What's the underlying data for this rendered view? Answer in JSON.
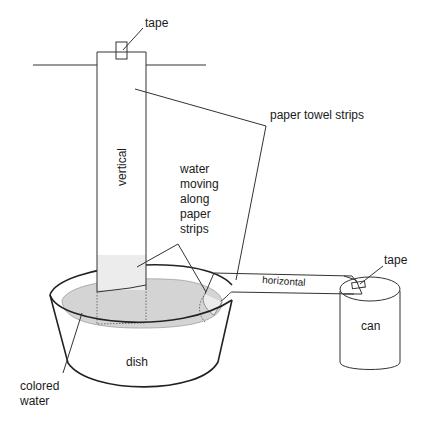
{
  "diagram": {
    "type": "experiment setup illustration",
    "labels": {
      "tape_top": "tape",
      "paper_towel_strips": "paper towel strips",
      "vertical": "vertical",
      "water_moving": [
        "water",
        "moving",
        "along",
        "paper",
        "strips"
      ],
      "tape_can": "tape",
      "horizontal": "horizontal",
      "can": "can",
      "dish": "dish",
      "colored_water": [
        "colored",
        "water"
      ]
    },
    "colors": {
      "line": "#333333",
      "water_fill": "#d4d4d4",
      "wet_strip": "#ececec",
      "background": "#ffffff"
    }
  }
}
